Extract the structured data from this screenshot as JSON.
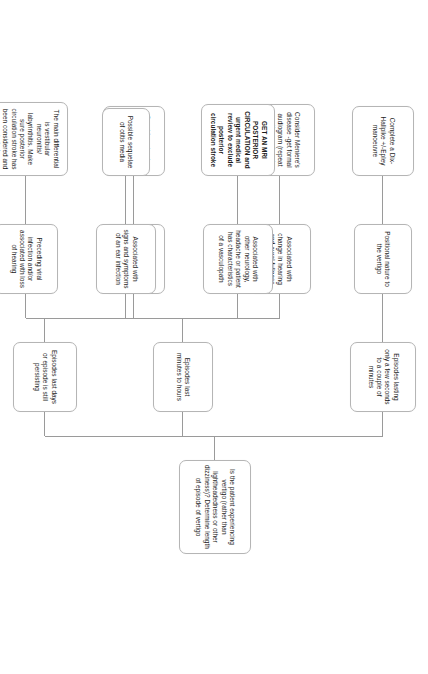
{
  "diagram": {
    "orientation": "rotated-90-clockwise",
    "line_color": "#9a9a9a",
    "node_border_color": "#b5b5b5",
    "node_background": "#ffffff",
    "nodes": {
      "root": "Is the patient experiencing vertigo (rather than lightheadedness or other dizziness)? Determine length of episode of vertigo",
      "branch1": "Episodes lasting only a few seconds to a couple of minutes",
      "branch1_child": "Positional nature to the vertigo",
      "branch1_leaf": "Complete a Dix-Hallpike +/-Epley manoeuvre",
      "branch2": "Episodes last minutes to hours",
      "branch2_child1": "Associated with change in hearing and aural fullness",
      "branch2_leaf1": "Consider Meniere's disease -get formal audiogram (repeat over time as hearing fluctuates)",
      "branch2_child2": "Associated with headache, aura or a history of migraine",
      "branch2_leaf2": "Consider migraine treatment or prophylaxis if required",
      "branch3": "Episodes last days or episode is still persisting",
      "branch3_child1": "Associated with other neurology, headache or patient has characteristics of a vasculopath",
      "branch3_leaf1": "GET AN MRI POSTERIOR CIRCULATION and urgent medical review to exclude posterior circulation stroke",
      "branch3_child2": "Associated with signs and symptoms of an ear infection",
      "branch3_leaf2": "Possible sequelae of otitis media",
      "branch3_child3": "Preceding viral infection and/or associated with loss of hearing",
      "branch3_leaf3": "The main differential is vestibular neuronitis/ labyrinthitis. Make sure posterior circulation stroke has been considered and excluded."
    }
  }
}
